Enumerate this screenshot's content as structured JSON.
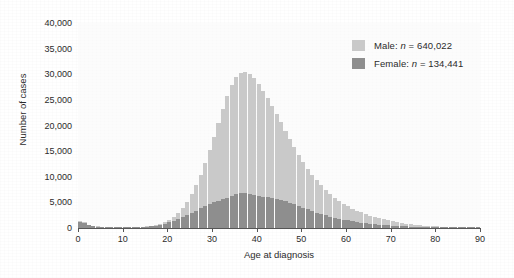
{
  "chart_data": {
    "type": "bar",
    "title": "",
    "subtitle": "",
    "xlabel": "Age at diagnosis",
    "ylabel": "Number of cases",
    "xlim": [
      0,
      90
    ],
    "ylim": [
      0,
      40000
    ],
    "grid": false,
    "legend_position": "top-right",
    "bar_mode": "overlay",
    "x_ticks": [
      0,
      10,
      20,
      30,
      40,
      50,
      60,
      70,
      80,
      90
    ],
    "x_tick_labels": [
      "0",
      "10",
      "20",
      "30",
      "40",
      "50",
      "60",
      "70",
      "80",
      "90"
    ],
    "y_ticks": [
      0,
      5000,
      10000,
      15000,
      20000,
      25000,
      30000,
      35000,
      40000
    ],
    "y_tick_labels": [
      "0",
      "5,000",
      "10,000",
      "15,000",
      "20,000",
      "25,000",
      "30,000",
      "35,000",
      "40,000"
    ],
    "x": [
      0,
      1,
      2,
      3,
      4,
      5,
      6,
      7,
      8,
      9,
      10,
      11,
      12,
      13,
      14,
      15,
      16,
      17,
      18,
      19,
      20,
      21,
      22,
      23,
      24,
      25,
      26,
      27,
      28,
      29,
      30,
      31,
      32,
      33,
      34,
      35,
      36,
      37,
      38,
      39,
      40,
      41,
      42,
      43,
      44,
      45,
      46,
      47,
      48,
      49,
      50,
      51,
      52,
      53,
      54,
      55,
      56,
      57,
      58,
      59,
      60,
      61,
      62,
      63,
      64,
      65,
      66,
      67,
      68,
      69,
      70,
      71,
      72,
      73,
      74,
      75,
      76,
      77,
      78,
      79,
      80,
      81,
      82,
      83,
      84,
      85,
      86,
      87,
      88,
      89
    ],
    "series": [
      {
        "name": "Male",
        "color": "#c9c9c9",
        "n_label": "Male: n = 640,022",
        "n_value": 640022,
        "values": [
          1450,
          1100,
          620,
          420,
          330,
          290,
          260,
          240,
          230,
          220,
          220,
          225,
          235,
          250,
          280,
          330,
          420,
          560,
          780,
          1100,
          1550,
          2150,
          2900,
          3900,
          5100,
          6600,
          8400,
          10400,
          12700,
          15200,
          17800,
          20500,
          23200,
          25800,
          27900,
          29500,
          30300,
          30500,
          30100,
          29200,
          28100,
          26800,
          25400,
          23900,
          22300,
          20700,
          19000,
          17400,
          15800,
          14300,
          12900,
          11600,
          10400,
          9300,
          8300,
          7400,
          6600,
          5900,
          5300,
          4750,
          4250,
          3800,
          3400,
          3050,
          2720,
          2430,
          2160,
          1920,
          1700,
          1500,
          1320,
          1160,
          1010,
          880,
          760,
          660,
          570,
          490,
          420,
          360,
          305,
          255,
          215,
          180,
          150,
          125,
          100,
          78,
          58,
          40
        ]
      },
      {
        "name": "Female",
        "color": "#8e8e8e",
        "n_label": "Female: n = 134,441",
        "n_value": 134441,
        "values": [
          1200,
          900,
          500,
          350,
          270,
          240,
          215,
          200,
          190,
          185,
          185,
          190,
          200,
          215,
          240,
          280,
          350,
          460,
          620,
          830,
          1080,
          1380,
          1720,
          2100,
          2520,
          2960,
          3400,
          3830,
          4240,
          4630,
          4990,
          5320,
          5620,
          5900,
          6200,
          6550,
          6780,
          6830,
          6700,
          6480,
          6250,
          6080,
          5960,
          5850,
          5700,
          5500,
          5250,
          4950,
          4620,
          4280,
          3950,
          3630,
          3320,
          3020,
          2740,
          2480,
          2240,
          2020,
          1820,
          1640,
          1470,
          1320,
          1180,
          1055,
          940,
          835,
          740,
          655,
          578,
          508,
          446,
          390,
          340,
          296,
          256,
          221,
          190,
          163,
          139,
          118,
          100,
          84,
          70,
          58,
          48,
          39,
          31,
          24,
          18,
          13
        ]
      }
    ]
  },
  "legend": {
    "rows": [
      {
        "label_main": "Male: ",
        "n_italic": "n",
        "n_rest": " = 640,022",
        "swatch": "male-swatch"
      },
      {
        "label_main": "Female: ",
        "n_italic": "n",
        "n_rest": " = 134,441",
        "swatch": "female-swatch"
      }
    ]
  },
  "axes": {
    "x_title": "Age at diagnosis",
    "y_title": "Number of cases"
  }
}
